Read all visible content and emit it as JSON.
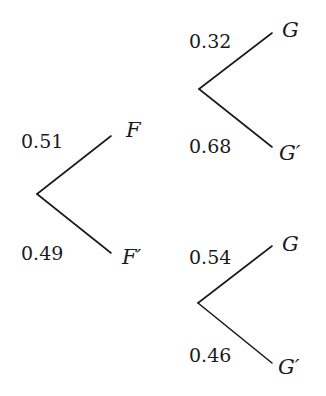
{
  "diagram": {
    "type": "probability-tree",
    "first_stage": {
      "branches": [
        {
          "label": "F",
          "probability": "0.51"
        },
        {
          "label": "F′",
          "probability": "0.49"
        }
      ]
    },
    "second_stage": {
      "given_F": {
        "branches": [
          {
            "label": "G",
            "probability": "0.32"
          },
          {
            "label": "G′",
            "probability": "0.68"
          }
        ]
      },
      "given_F_prime": {
        "branches": [
          {
            "label": "G",
            "probability": "0.54"
          },
          {
            "label": "G′",
            "probability": "0.46"
          }
        ]
      }
    },
    "line_color": "#1a1a1a"
  }
}
